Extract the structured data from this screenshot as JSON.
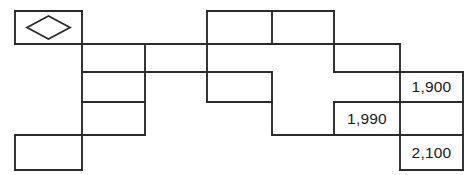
{
  "diagram": {
    "type": "block-grid-diagram",
    "background_color": "#ffffff",
    "line_color": "#2b2b2b",
    "text_color": "#1a1a1a",
    "icon": {
      "name": "diamond-icon",
      "cell": "top-left-block"
    },
    "labels": [
      {
        "id": "label-1900",
        "text": "1,900",
        "x": 400,
        "y": 72,
        "width": 63,
        "height": 30
      },
      {
        "id": "label-1990",
        "text": "1,990",
        "x": 334,
        "y": 102,
        "width": 66,
        "height": 33
      },
      {
        "id": "label-2100",
        "text": "2,100",
        "x": 400,
        "y": 135,
        "width": 63,
        "height": 35
      }
    ],
    "blocks": [
      {
        "id": "block-diamond",
        "x": 15,
        "y": 11,
        "width": 67,
        "height": 33,
        "label": ""
      },
      {
        "id": "block-top-mid-left",
        "x": 207,
        "y": 11,
        "width": 65,
        "height": 33,
        "label": ""
      },
      {
        "id": "block-top-mid-right",
        "x": 272,
        "y": 11,
        "width": 62,
        "height": 33,
        "label": ""
      },
      {
        "id": "block-row2-left",
        "x": 82,
        "y": 44,
        "width": 63,
        "height": 28,
        "label": ""
      },
      {
        "id": "block-row2-mid",
        "x": 145,
        "y": 44,
        "width": 62,
        "height": 28,
        "label": ""
      },
      {
        "id": "block-row2-center",
        "x": 207,
        "y": 44,
        "width": 127,
        "height": 28,
        "label": ""
      },
      {
        "id": "block-row2-right",
        "x": 334,
        "y": 44,
        "width": 66,
        "height": 28,
        "label": ""
      },
      {
        "id": "block-row3-left",
        "x": 82,
        "y": 72,
        "width": 63,
        "height": 30,
        "label": ""
      },
      {
        "id": "block-row3-center",
        "x": 207,
        "y": 72,
        "width": 65,
        "height": 30,
        "label": ""
      },
      {
        "id": "block-row3-right",
        "x": 400,
        "y": 72,
        "width": 63,
        "height": 30,
        "label": "1,900"
      },
      {
        "id": "block-row4-left",
        "x": 82,
        "y": 102,
        "width": 63,
        "height": 33,
        "label": ""
      },
      {
        "id": "block-row4-center",
        "x": 272,
        "y": 102,
        "width": 62,
        "height": 33,
        "label": ""
      },
      {
        "id": "block-row4-right",
        "x": 334,
        "y": 102,
        "width": 66,
        "height": 33,
        "label": "1,990"
      },
      {
        "id": "block-bottom-left",
        "x": 15,
        "y": 135,
        "width": 67,
        "height": 35,
        "label": ""
      },
      {
        "id": "block-bottom-right",
        "x": 400,
        "y": 135,
        "width": 63,
        "height": 35,
        "label": "2,100"
      }
    ]
  }
}
